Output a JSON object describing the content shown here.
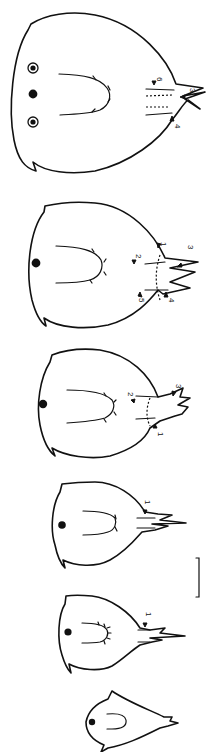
{
  "figure": {
    "stages": [
      {
        "id": "stage-6",
        "labels": [
          "6",
          "3",
          "4"
        ],
        "eyes": "three (two ringed, one solid)"
      },
      {
        "id": "stage-5",
        "labels": [
          "1",
          "2",
          "3",
          "4",
          "5"
        ],
        "eyes": "one solid"
      },
      {
        "id": "stage-4",
        "labels": [
          "2",
          "3",
          "1"
        ],
        "eyes": "one solid"
      },
      {
        "id": "stage-3",
        "labels": [
          "1"
        ],
        "eyes": "one solid"
      },
      {
        "id": "stage-2",
        "labels": [
          "1"
        ],
        "eyes": "one solid"
      },
      {
        "id": "stage-1",
        "labels": [],
        "eyes": "one solid"
      }
    ],
    "scale_bar": {
      "present": true,
      "label": ""
    }
  }
}
